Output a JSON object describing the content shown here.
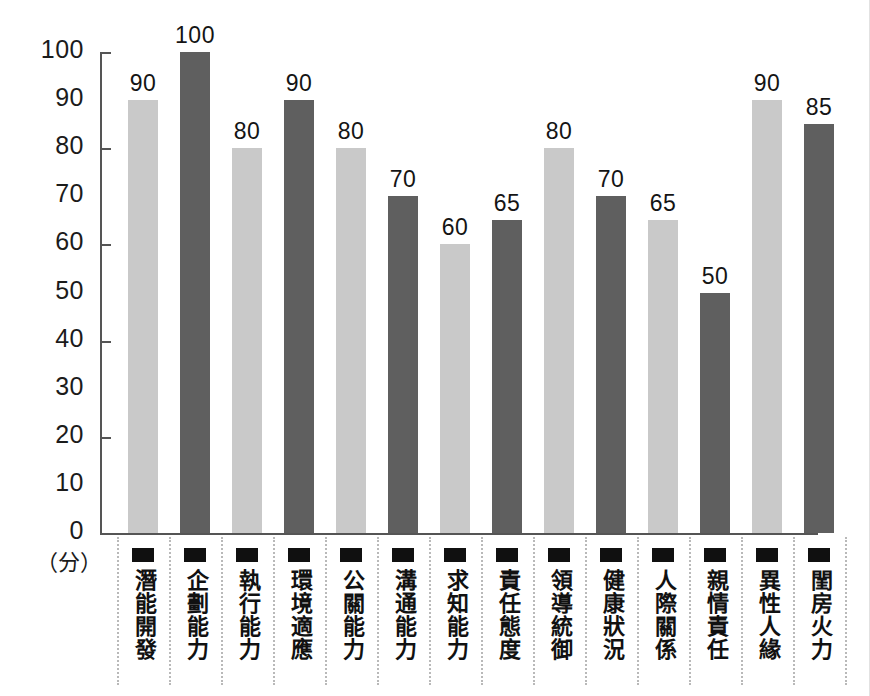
{
  "chart_data": {
    "type": "bar",
    "title": "",
    "xlabel": "",
    "ylabel": "",
    "unit_label": "（分）",
    "ylim": [
      0,
      100
    ],
    "ytick_values": [
      0,
      10,
      20,
      30,
      40,
      50,
      60,
      70,
      80,
      90,
      100
    ],
    "ytick_labels": [
      "0",
      "10",
      "20",
      "30",
      "40",
      "50",
      "60",
      "70",
      "80",
      "90",
      "100"
    ],
    "major_tick_values": [
      20,
      40,
      60,
      80,
      100
    ],
    "grid": false,
    "legend": "none",
    "categories": [
      "潛能開發",
      "企劃能力",
      "執行能力",
      "環境適應",
      "公關能力",
      "溝通能力",
      "求知能力",
      "責任態度",
      "領導統御",
      "健康狀況",
      "人際關係",
      "親情責任",
      "異性人緣",
      "閨房火力"
    ],
    "values": [
      90,
      100,
      80,
      90,
      80,
      70,
      60,
      65,
      80,
      70,
      65,
      50,
      90,
      85
    ],
    "bar_shades": [
      "light",
      "dark",
      "light",
      "dark",
      "light",
      "dark",
      "light",
      "dark",
      "light",
      "dark",
      "light",
      "dark",
      "light",
      "dark"
    ],
    "colors": {
      "light_bar": "#c9c9c9",
      "dark_bar": "#5f5f5f",
      "axis": "#555555",
      "text": "#141414",
      "separator": "#b9b9b9",
      "background": "#ffffff"
    }
  }
}
